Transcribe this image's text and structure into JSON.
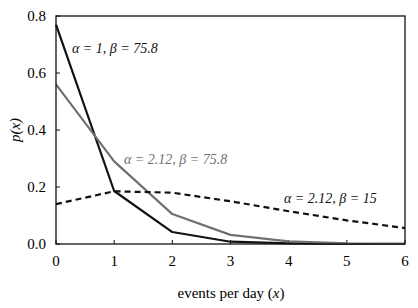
{
  "chart_data": {
    "type": "line",
    "title": "",
    "xlabel": "events per day (x)",
    "ylabel": "p(x)",
    "xlim": [
      0,
      6
    ],
    "ylim": [
      0,
      0.8
    ],
    "x": [
      0,
      1,
      2,
      3,
      4,
      5,
      6
    ],
    "x_ticks": [
      "0",
      "1",
      "2",
      "3",
      "4",
      "5",
      "6"
    ],
    "y_ticks": [
      "0.0",
      "0.2",
      "0.4",
      "0.6",
      "0.8"
    ],
    "grid": false,
    "legend": "inline annotations",
    "series": [
      {
        "name": "α = 1, β = 75.8",
        "color": "#111111",
        "style": "solid",
        "values": [
          0.77,
          0.186,
          0.042,
          0.008,
          0.002,
          0.0,
          0.0
        ]
      },
      {
        "name": "α = 2.12, β = 75.8",
        "color": "#707070",
        "style": "solid",
        "values": [
          0.56,
          0.29,
          0.105,
          0.032,
          0.009,
          0.002,
          0.001
        ]
      },
      {
        "name": "α = 2.12, β = 15",
        "color": "#111111",
        "style": "dashed",
        "values": [
          0.14,
          0.185,
          0.18,
          0.15,
          0.115,
          0.083,
          0.056
        ]
      }
    ]
  },
  "labels": {
    "xlabel_main": "events per day (",
    "xlabel_var": "x",
    "xlabel_end": ")",
    "ylabel": "p(x)",
    "ann1": "α = 1, β = 75.8",
    "ann2": "α = 2.12, β = 75.8",
    "ann3": "α = 2.12, β = 15"
  }
}
